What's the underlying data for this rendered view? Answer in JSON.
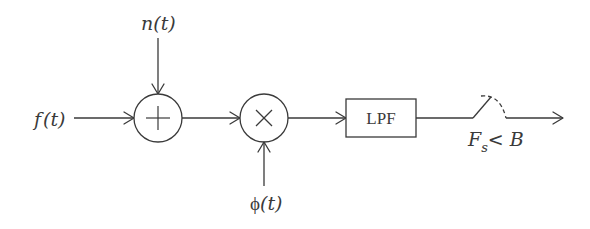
{
  "diagram": {
    "type": "signal-processing-block-diagram",
    "colors": {
      "stroke": "#3a3a3a",
      "background": "#ffffff"
    },
    "inputs": {
      "signal": {
        "label_fn": "f",
        "label_arg": "(t)"
      },
      "noise": {
        "label_fn": "n",
        "label_arg": "(t)"
      },
      "carrier": {
        "label_fn": "ϕ",
        "label_arg": "(t)"
      }
    },
    "nodes": [
      {
        "id": "summer",
        "kind": "sum-junction",
        "symbol": "plus-icon"
      },
      {
        "id": "mixer",
        "kind": "multiplier",
        "symbol": "times-icon"
      },
      {
        "id": "lpf",
        "kind": "block",
        "label": "LPF"
      },
      {
        "id": "sampler",
        "kind": "switch",
        "label_main": "F",
        "label_sub": "s",
        "label_rest": "< B"
      }
    ],
    "edges": [
      {
        "from": "f(t)",
        "to": "summer"
      },
      {
        "from": "n(t)",
        "to": "summer"
      },
      {
        "from": "summer",
        "to": "mixer"
      },
      {
        "from": "ϕ(t)",
        "to": "mixer"
      },
      {
        "from": "mixer",
        "to": "lpf"
      },
      {
        "from": "lpf",
        "to": "sampler"
      },
      {
        "from": "sampler",
        "to": "output"
      }
    ]
  }
}
